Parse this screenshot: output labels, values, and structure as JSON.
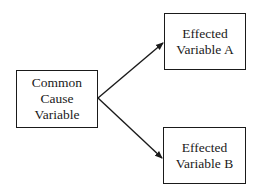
{
  "diagram": {
    "type": "causal-diagram",
    "nodes": [
      {
        "id": "cause",
        "lines": [
          "Common",
          "Cause",
          "Variable"
        ]
      },
      {
        "id": "effect_a",
        "lines": [
          "Effected",
          "Variable A"
        ]
      },
      {
        "id": "effect_b",
        "lines": [
          "Effected",
          "Variable B"
        ]
      }
    ],
    "edges": [
      {
        "from": "cause",
        "to": "effect_a",
        "style": "arrow"
      },
      {
        "from": "cause",
        "to": "effect_b",
        "style": "arrow"
      }
    ],
    "colors": {
      "stroke": "#1a1a1a",
      "background": "#ffffff"
    }
  }
}
